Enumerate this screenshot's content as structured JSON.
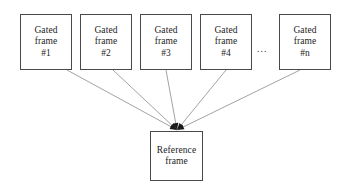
{
  "diagram": {
    "canvas": {
      "width": 346,
      "height": 191,
      "background": "#ffffff"
    },
    "style": {
      "box_border_color": "#4a4a4a",
      "edge_color": "#8a8a8a",
      "arrowhead_color": "#1a1a1a",
      "text_color": "#1c1c1c"
    },
    "ellipsis": {
      "label": "...",
      "x": 257,
      "y": 44
    },
    "sources": [
      {
        "id": "gated-frame-1",
        "line1": "Gated",
        "line2": "frame",
        "line3": "#1",
        "x": 20,
        "y": 14,
        "w": 52,
        "h": 56,
        "edge_from_x": 67,
        "edge_from_y": 70
      },
      {
        "id": "gated-frame-2",
        "line1": "Gated",
        "line2": "frame",
        "line3": "#2",
        "x": 80,
        "y": 14,
        "w": 52,
        "h": 56,
        "edge_from_x": 113,
        "edge_from_y": 70
      },
      {
        "id": "gated-frame-3",
        "line1": "Gated",
        "line2": "frame",
        "line3": "#3",
        "x": 140,
        "y": 14,
        "w": 52,
        "h": 56,
        "edge_from_x": 166,
        "edge_from_y": 70
      },
      {
        "id": "gated-frame-4",
        "line1": "Gated",
        "line2": "frame",
        "line3": "#4",
        "x": 200,
        "y": 14,
        "w": 52,
        "h": 56,
        "edge_from_x": 226,
        "edge_from_y": 70
      },
      {
        "id": "gated-frame-n",
        "line1": "Gated",
        "line2": "frame",
        "line3": "#n",
        "x": 279,
        "y": 14,
        "w": 52,
        "h": 56,
        "edge_from_x": 300,
        "edge_from_y": 70
      }
    ],
    "target": {
      "id": "reference-frame",
      "line1": "Reference",
      "line2": "frame",
      "x": 150,
      "y": 131,
      "w": 53,
      "h": 50,
      "converge_x": 177,
      "converge_y": 130
    }
  }
}
